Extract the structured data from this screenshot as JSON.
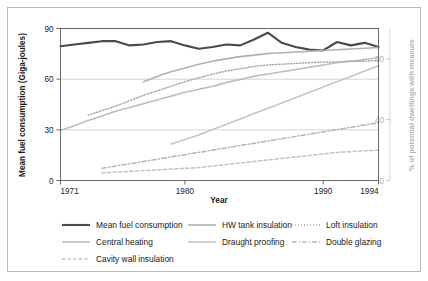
{
  "figure": {
    "border_color": "#b9b9b9",
    "background": "#ffffff"
  },
  "chart_data": {
    "type": "line",
    "title": "",
    "subtitle": "",
    "xlabel": "Year",
    "ylabel": "Mean fuel consumption (Giga-joules)",
    "y2label": "% of potential dwellings with measure",
    "grid": true,
    "grid_axis": "y",
    "legend_position": "bottom",
    "xlim": [
      1971,
      1994
    ],
    "ylim": [
      0,
      90
    ],
    "y2lim": [
      0,
      100
    ],
    "xticks": [
      1971,
      1980,
      1990,
      1994
    ],
    "xticklabels": [
      "1971",
      "1980",
      "1990",
      "1994"
    ],
    "yticks": [
      0,
      30,
      60,
      90
    ],
    "yticklabels": [
      "0",
      "30",
      "60",
      "90"
    ],
    "y2ticks": [
      0,
      40,
      80
    ],
    "y2ticklabels": [
      "0",
      "40",
      "80"
    ],
    "x": [
      1971,
      1972,
      1973,
      1974,
      1975,
      1976,
      1977,
      1978,
      1979,
      1980,
      1981,
      1982,
      1983,
      1984,
      1985,
      1986,
      1987,
      1988,
      1989,
      1990,
      1991,
      1992,
      1993,
      1994
    ],
    "series": [
      {
        "name": "Mean fuel consumption",
        "axis": "left",
        "color": "#4a4a4a",
        "style": "solid",
        "width": 2.1,
        "units": "Giga-joules",
        "values": [
          79.5,
          80.5,
          81.5,
          82.5,
          82.5,
          80.0,
          80.5,
          82.0,
          82.5,
          80.0,
          78.0,
          79.0,
          80.5,
          80.0,
          83.5,
          87.5,
          81.5,
          79.0,
          77.5,
          77.0,
          82.0,
          80.0,
          81.5,
          79.0
        ]
      },
      {
        "name": "Central heating",
        "axis": "right",
        "color": "#bdbdbd",
        "style": "solid",
        "width": 1.6,
        "units": "%",
        "values": [
          33.0,
          36.0,
          39.5,
          42.5,
          45.5,
          48.0,
          50.5,
          53.0,
          55.5,
          58.0,
          60.0,
          62.0,
          64.5,
          66.5,
          68.5,
          70.0,
          71.5,
          73.0,
          74.5,
          76.0,
          77.5,
          78.5,
          79.5,
          81.0
        ]
      },
      {
        "name": "HW tank insulation",
        "axis": "right",
        "color": "#b0b0b0",
        "style": "solid",
        "width": 1.6,
        "units": "%",
        "values": [
          null,
          null,
          null,
          null,
          null,
          null,
          65.0,
          68.5,
          71.5,
          74.0,
          76.5,
          78.5,
          80.0,
          81.5,
          82.5,
          83.5,
          84.0,
          84.5,
          85.0,
          85.5,
          86.0,
          86.5,
          87.0,
          87.5
        ]
      },
      {
        "name": "Loft insulation",
        "axis": "right",
        "color": "#a8a8a8",
        "style": "dotted",
        "width": 1.5,
        "units": "%",
        "values": [
          null,
          null,
          43.0,
          46.0,
          49.0,
          52.5,
          56.0,
          59.0,
          62.0,
          65.0,
          67.5,
          70.0,
          72.0,
          73.5,
          75.0,
          76.0,
          76.5,
          77.0,
          77.5,
          78.0,
          78.0,
          78.5,
          78.5,
          79.0
        ]
      },
      {
        "name": "Draught proofing",
        "axis": "right",
        "color": "#c6c6c6",
        "style": "solid",
        "width": 1.6,
        "units": "%",
        "values": [
          null,
          null,
          null,
          null,
          null,
          null,
          null,
          null,
          24.0,
          27.0,
          30.0,
          33.5,
          37.0,
          40.5,
          44.0,
          47.5,
          51.0,
          54.5,
          58.0,
          61.5,
          65.0,
          68.5,
          72.0,
          75.5
        ]
      },
      {
        "name": "Double glazing",
        "axis": "right",
        "color": "#b5b5b5",
        "style": "dashdot",
        "width": 1.5,
        "units": "%",
        "values": [
          null,
          null,
          null,
          8.0,
          9.5,
          11.0,
          12.5,
          14.0,
          15.5,
          17.0,
          18.5,
          20.0,
          21.5,
          23.0,
          24.5,
          26.0,
          27.5,
          29.0,
          30.5,
          32.0,
          33.5,
          35.0,
          36.5,
          38.0
        ]
      },
      {
        "name": "Cavity wall insulation",
        "axis": "right",
        "color": "#c2c2c2",
        "style": "dashed",
        "width": 1.5,
        "units": "%",
        "values": [
          null,
          null,
          null,
          5.0,
          5.5,
          6.0,
          6.5,
          7.0,
          7.5,
          8.0,
          8.5,
          9.5,
          10.5,
          11.5,
          12.5,
          13.5,
          14.5,
          15.5,
          16.5,
          17.5,
          18.5,
          19.0,
          19.5,
          20.0
        ]
      }
    ]
  },
  "legend": {
    "entries": [
      {
        "label": "Mean fuel consumption",
        "series": "Mean fuel consumption"
      },
      {
        "label": "HW tank insulation",
        "series": "HW tank insulation"
      },
      {
        "label": "Loft insulation",
        "series": "Loft insulation"
      },
      {
        "label": "Central heating",
        "series": "Central heating"
      },
      {
        "label": "Draught proofing",
        "series": "Draught proofing"
      },
      {
        "label": "Double glazing",
        "series": "Double glazing"
      },
      {
        "label": "Cavity wall insulation",
        "series": "Cavity wall insulation"
      }
    ]
  }
}
